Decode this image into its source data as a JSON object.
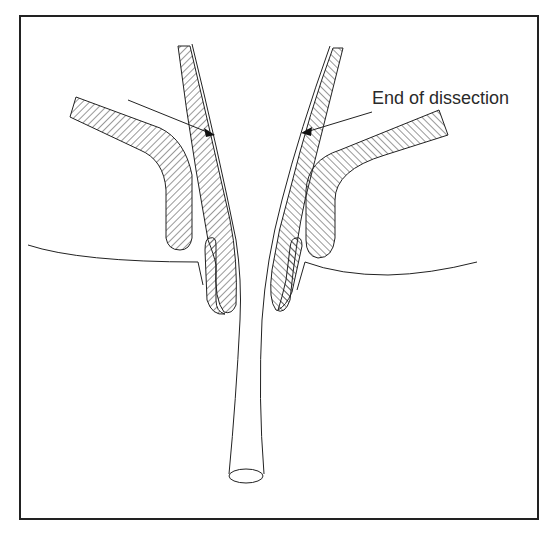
{
  "diagram": {
    "annotation": "End of dissection",
    "colors": {
      "stroke": "#222222",
      "background": "#ffffff"
    }
  }
}
